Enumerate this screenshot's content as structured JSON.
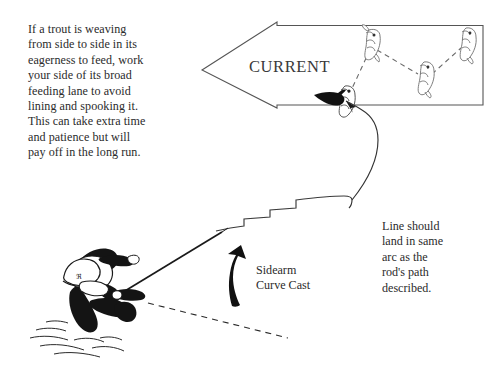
{
  "figure": {
    "background_color": "#ffffff",
    "ink_color": "#1a1a1a",
    "text_color": "#2b2b2b"
  },
  "annotations": {
    "weaving_note": "If a trout is weaving\nfrom side to side in its\neagerness to feed, work\nyour side of its broad\nfeeding lane to avoid\nlining and spooking it.\nThis can take extra time\nand patience but will\npay off in the long run.",
    "arc_note": "Line should\nland in same\narc as the\nrod's path\ndescribed.",
    "cast_label": "Sidearm\nCurve Cast",
    "current_label": "CURRENT"
  },
  "elements": {
    "current_arrow": {
      "name": "current-arrow",
      "direction": "left",
      "tip_x": 202,
      "tip_y": 70,
      "notch_x": 277,
      "top_y": 22,
      "bottom_y": 108,
      "right_x": 483,
      "fill": "none",
      "stroke": "#4a4a4a"
    },
    "trout": [
      {
        "name": "trout-lane-left-lower",
        "x": 345,
        "y": 96,
        "facing": "left",
        "highlighted": true
      },
      {
        "name": "trout-lane-upper",
        "x": 371,
        "y": 43,
        "facing": "left",
        "highlighted": false
      },
      {
        "name": "trout-lane-middle",
        "x": 425,
        "y": 78,
        "facing": "left",
        "highlighted": false
      },
      {
        "name": "trout-lane-right",
        "x": 468,
        "y": 42,
        "facing": "left",
        "highlighted": false
      }
    ],
    "weave_path": {
      "name": "trout-weaving-dashed-path",
      "style": "dashed",
      "points": "346,94 370,52 424,76 466,46"
    },
    "line_arc": {
      "name": "fly-line-arc",
      "style": "solid-curve",
      "arrowhead_at": "trout-lane-left-lower"
    },
    "rod_path": {
      "name": "rod-path-stepped-line",
      "style": "stepped",
      "from_x": 216,
      "from_y": 231,
      "to_x": 352,
      "to_y": 200
    },
    "angler": {
      "name": "angler-figure",
      "pose": "crouching",
      "x": 60,
      "y": 250
    },
    "cast_arrow": {
      "name": "cast-direction-arrow",
      "fill": "#111111",
      "direction": "up-curving"
    },
    "back_cast_line": {
      "name": "back-cast-dashed-line",
      "style": "dashed"
    },
    "water": {
      "name": "water-surface-ripples"
    }
  }
}
